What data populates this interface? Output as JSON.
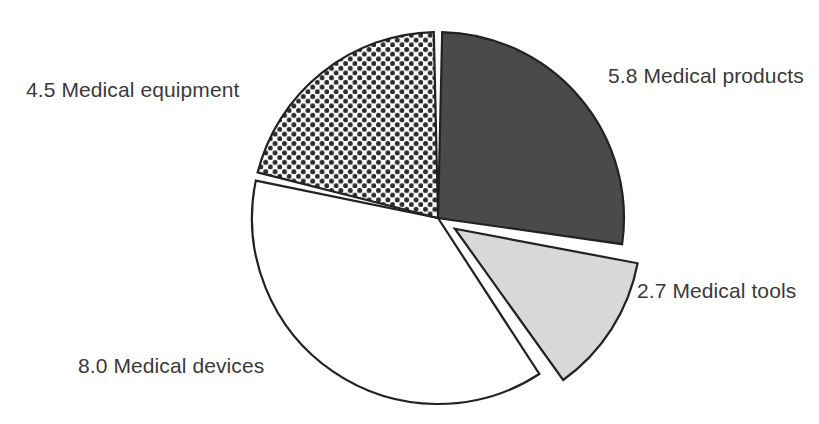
{
  "chart_data": {
    "type": "pie",
    "title": "",
    "subtitle": "",
    "xlabel": "",
    "ylabel": "",
    "legend_position": "none",
    "grid": false,
    "total": 21.0,
    "categories": [
      "Medical products",
      "Medical tools",
      "Medical devices",
      "Medical equipment"
    ],
    "values": [
      5.8,
      2.7,
      8.0,
      4.5
    ],
    "slices": [
      {
        "key": "products",
        "label": "5.8 Medical products",
        "name": "Medical products",
        "value": 5.8,
        "fill_style": "solid-dark-gray",
        "color": "#4a4a4a",
        "exploded": false,
        "start_angle_deg": 0.0,
        "end_angle_deg": 99.4
      },
      {
        "key": "tools",
        "label": "2.7 Medical tools",
        "name": "Medical tools",
        "value": 2.7,
        "fill_style": "solid-light-gray",
        "color": "#d8d8d8",
        "exploded": true,
        "start_angle_deg": 99.4,
        "end_angle_deg": 145.7
      },
      {
        "key": "devices",
        "label": "8.0 Medical devices",
        "name": "Medical devices",
        "value": 8.0,
        "fill_style": "solid-white",
        "color": "#ffffff",
        "exploded": false,
        "start_angle_deg": 145.7,
        "end_angle_deg": 282.9
      },
      {
        "key": "equipment",
        "label": "4.5 Medical equipment",
        "name": "Medical equipment",
        "value": 4.5,
        "fill_style": "dotted-pattern",
        "color": "#ffffff",
        "pattern_color": "#2b2b2b",
        "exploded": false,
        "start_angle_deg": 282.9,
        "end_angle_deg": 360.0
      }
    ],
    "outline_color": "#222222",
    "background_color": "#ffffff"
  },
  "geometry": {
    "center_x": 438,
    "center_y": 218,
    "radius": 186,
    "gap_deg": 2.6,
    "explode_offset": 20
  },
  "labels": {
    "equipment": "4.5 Medical equipment",
    "products": "5.8 Medical products",
    "tools": "2.7 Medical tools",
    "devices": "8.0 Medical devices"
  }
}
